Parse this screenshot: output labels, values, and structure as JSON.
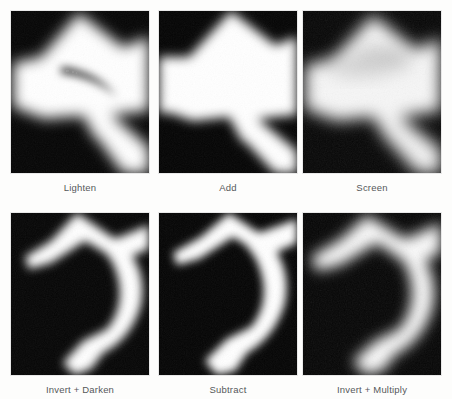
{
  "figure": {
    "background_color": "#fdfdfc",
    "caption_color": "#55585a",
    "panel_background": "#030303",
    "panel_width": 138,
    "panel_height": 162,
    "columns": 3,
    "rows": 2
  },
  "panels": [
    {
      "id": "lighten",
      "label": "Lighten",
      "row": 0,
      "col": 0,
      "x": 10,
      "y": 10,
      "description": "Large soft-edged white blob filling most of the frame with dark corners top-left, lower-left and lower-right; a thin dark crescent arcs through the middle-right."
    },
    {
      "id": "add",
      "label": "Add",
      "row": 0,
      "col": 1,
      "x": 158,
      "y": 10,
      "description": "Broad white diamond/arrowhead shape, dark wedges at top-left, top-right and bottom band with a notch."
    },
    {
      "id": "screen",
      "label": "Screen",
      "row": 0,
      "col": 2,
      "x": 302,
      "y": 10,
      "description": "Softer, lower-contrast white arrow shape with faint gray mottling in the upper middle; dark corners."
    },
    {
      "id": "invert-darken",
      "label": "Invert + Darken",
      "row": 1,
      "col": 0,
      "x": 10,
      "y": 212,
      "description": "Mostly black frame with a bright white S/Z shaped band sweeping from upper-left across to the right and down to the bottom."
    },
    {
      "id": "subtract",
      "label": "Subtract",
      "row": 1,
      "col": 1,
      "x": 158,
      "y": 212,
      "description": "Black frame with a crisp white hook-shaped band from the top edge curving right then down to the bottom-center."
    },
    {
      "id": "invert-multiply",
      "label": "Invert + Multiply",
      "row": 1,
      "col": 2,
      "x": 302,
      "y": 212,
      "description": "Black frame with a soft, blurrier white hook band, wider and more diffuse than Subtract."
    }
  ]
}
